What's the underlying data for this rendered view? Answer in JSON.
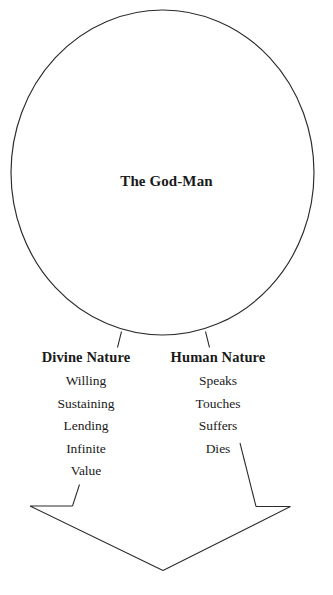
{
  "diagram": {
    "title": "The God-Man",
    "circle_label": "The God-Man",
    "columns": [
      {
        "id": "divine",
        "heading": "Divine Nature",
        "items": [
          "Willing",
          "Sustaining",
          "Lending",
          "Infinite",
          "Value"
        ]
      },
      {
        "id": "human",
        "heading": "Human Nature",
        "items": [
          "Speaks",
          "Touches",
          "Suffers",
          "Dies"
        ]
      }
    ],
    "colors": {
      "stroke": "#2b2b2b",
      "text": "#1a1a1a",
      "background": "#ffffff"
    },
    "shapes": {
      "circle": "circle-outline",
      "arrow": "down-arrow-outline",
      "connector_left": "connector-tick-left",
      "connector_right": "connector-tick-right"
    }
  }
}
